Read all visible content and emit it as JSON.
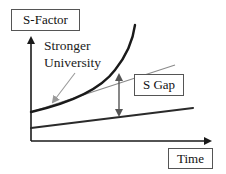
{
  "diagram": {
    "y_axis_label": "S-Factor",
    "x_axis_label": "Time",
    "annotations": {
      "stronger_line1": "Stronger",
      "stronger_line2": "University",
      "gap_label": "S Gap"
    },
    "colors": {
      "axis": "#1a1a1a",
      "curve": "#1a1a1a",
      "tangent": "#8a8a8a",
      "pointer": "#9a9a9a",
      "gap_arrow": "#555555",
      "box_border": "#555555"
    },
    "elements": [
      {
        "type": "axis",
        "name": "y-axis",
        "from": [
          31,
          141
        ],
        "to": [
          31,
          35
        ]
      },
      {
        "type": "axis",
        "name": "x-axis",
        "from": [
          31,
          141
        ],
        "to": [
          213,
          141
        ]
      },
      {
        "type": "curve",
        "name": "stronger-university-curve",
        "desc": "exponential growth curve starting at (31,112) rising to (135,25)"
      },
      {
        "type": "line",
        "name": "tangent-line",
        "from": [
          31,
          112
        ],
        "to": [
          175,
          65
        ]
      },
      {
        "type": "line",
        "name": "baseline-line",
        "from": [
          31,
          128
        ],
        "to": [
          193,
          108
        ]
      },
      {
        "type": "double-arrow",
        "name": "s-gap-arrow",
        "from": [
          119,
          72
        ],
        "to": [
          119,
          118
        ]
      },
      {
        "type": "arrow",
        "name": "pointer-arrow",
        "from": [
          75,
          73
        ],
        "to": [
          51,
          105
        ]
      }
    ]
  }
}
